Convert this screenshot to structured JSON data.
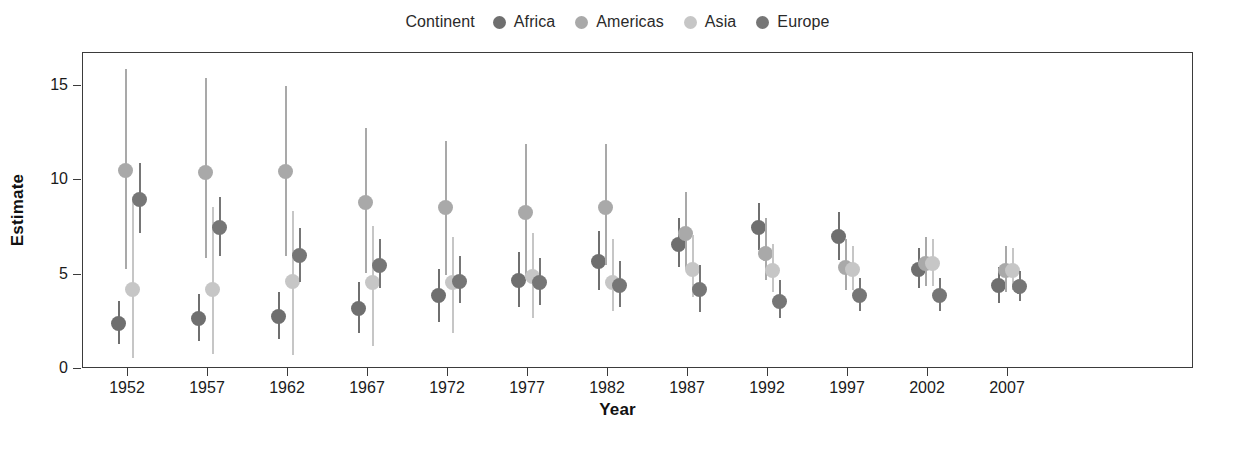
{
  "legend": {
    "title": "Continent",
    "position": "top",
    "items": [
      {
        "label": "Africa",
        "color": "#6f6f6f"
      },
      {
        "label": "Americas",
        "color": "#a9a9a9"
      },
      {
        "label": "Asia",
        "color": "#c6c6c6"
      },
      {
        "label": "Europe",
        "color": "#767676"
      }
    ]
  },
  "axes": {
    "y": {
      "title": "Estimate",
      "ticks": [
        "0",
        "5",
        "10",
        "15"
      ]
    },
    "x": {
      "title": "Year",
      "ticks": [
        "1952",
        "1957",
        "1962",
        "1967",
        "1972",
        "1977",
        "1982",
        "1987",
        "1992",
        "1997",
        "2002",
        "2007"
      ]
    }
  },
  "chart_data": {
    "type": "scatter",
    "subtype": "pointrange-dodged",
    "title": "",
    "xlabel": "Year",
    "ylabel": "Estimate",
    "legend_title": "Continent",
    "legend_position": "top",
    "grid": false,
    "ylim": [
      0,
      16.5
    ],
    "yticks": [
      0,
      5,
      10,
      15
    ],
    "x": [
      1952,
      1957,
      1962,
      1967,
      1972,
      1977,
      1982,
      1987,
      1992,
      1997,
      2002,
      2007
    ],
    "series": [
      {
        "name": "Africa",
        "color": "#6f6f6f",
        "values": [
          2.4,
          2.7,
          2.8,
          3.2,
          3.9,
          4.7,
          5.7,
          6.6,
          7.5,
          7.0,
          5.3,
          4.4
        ],
        "ymin": [
          1.3,
          1.5,
          1.6,
          1.9,
          2.5,
          3.3,
          4.2,
          5.4,
          6.3,
          5.8,
          4.3,
          3.5
        ],
        "ymax": [
          3.6,
          4.0,
          4.1,
          4.6,
          5.3,
          6.2,
          7.3,
          8.0,
          8.8,
          8.3,
          6.4,
          5.4
        ]
      },
      {
        "name": "Americas",
        "color": "#a9a9a9",
        "values": [
          10.5,
          10.4,
          10.45,
          8.8,
          8.55,
          8.3,
          8.55,
          7.2,
          6.1,
          5.4,
          5.6,
          5.2
        ],
        "ymin": [
          5.3,
          5.9,
          6.0,
          5.1,
          5.0,
          4.8,
          5.5,
          5.3,
          4.7,
          4.2,
          4.4,
          4.1
        ],
        "ymax": [
          15.9,
          15.4,
          15.0,
          12.8,
          12.1,
          11.9,
          11.9,
          9.4,
          8.0,
          6.9,
          7.0,
          6.5
        ]
      },
      {
        "name": "Asia",
        "color": "#c6c6c6",
        "values": [
          4.2,
          4.2,
          4.65,
          4.6,
          4.6,
          4.9,
          4.6,
          5.3,
          5.2,
          5.3,
          5.6,
          5.2
        ],
        "ymin": [
          0.6,
          0.8,
          0.75,
          1.2,
          1.9,
          2.7,
          3.1,
          3.8,
          4.1,
          4.2,
          4.4,
          4.2
        ],
        "ymax": [
          9.0,
          8.6,
          8.4,
          7.6,
          7.0,
          7.2,
          6.9,
          7.1,
          6.6,
          6.5,
          6.9,
          6.4
        ]
      },
      {
        "name": "Europe",
        "color": "#767676",
        "values": [
          9.0,
          7.5,
          6.0,
          5.5,
          4.65,
          4.6,
          4.45,
          4.2,
          3.6,
          3.9,
          3.9,
          4.35
        ],
        "ymin": [
          7.2,
          6.0,
          4.6,
          4.3,
          3.5,
          3.4,
          3.3,
          3.0,
          2.7,
          3.1,
          3.1,
          3.6
        ],
        "ymax": [
          10.9,
          9.1,
          7.5,
          6.9,
          6.0,
          5.9,
          5.7,
          5.5,
          4.7,
          4.8,
          4.8,
          5.2
        ]
      }
    ]
  }
}
